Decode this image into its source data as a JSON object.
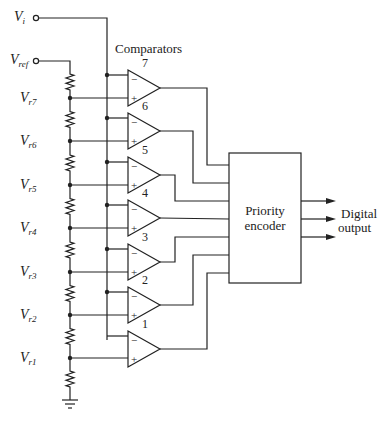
{
  "inputs": {
    "vi": "V",
    "vi_sub": "i",
    "vref": "V",
    "vref_sub": "ref"
  },
  "title": "Comparators",
  "taps": [
    {
      "label": "V",
      "sub": "r7"
    },
    {
      "label": "V",
      "sub": "r6"
    },
    {
      "label": "V",
      "sub": "r5"
    },
    {
      "label": "V",
      "sub": "r4"
    },
    {
      "label": "V",
      "sub": "r3"
    },
    {
      "label": "V",
      "sub": "r2"
    },
    {
      "label": "V",
      "sub": "r1"
    }
  ],
  "comparators": [
    "7",
    "6",
    "5",
    "4",
    "3",
    "2",
    "1"
  ],
  "encoder": {
    "line1": "Priority",
    "line2": "encoder"
  },
  "output": {
    "line1": "Digital",
    "line2": "output"
  },
  "signs": {
    "minus": "−",
    "plus": "+"
  }
}
